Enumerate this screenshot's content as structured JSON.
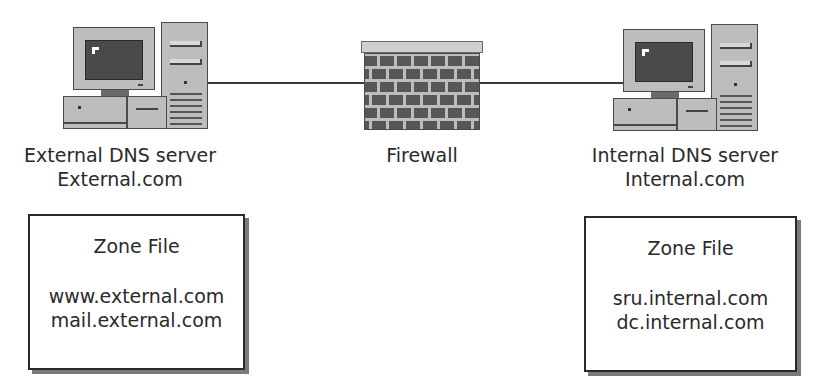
{
  "diagram": {
    "type": "network-dns-split",
    "nodes": [
      {
        "id": "external",
        "icon": "computer-icon",
        "label_line1": "External DNS server",
        "label_line2": "External.com"
      },
      {
        "id": "firewall",
        "icon": "brick-wall-icon",
        "label": "Firewall"
      },
      {
        "id": "internal",
        "icon": "computer-icon",
        "label_line1": "Internal DNS server",
        "label_line2": "Internal.com"
      }
    ],
    "edges": [
      {
        "from": "external",
        "to": "firewall"
      },
      {
        "from": "firewall",
        "to": "internal"
      }
    ],
    "zone_files": [
      {
        "owner": "external",
        "title": "Zone File",
        "entries": [
          "www.external.com",
          "mail.external.com"
        ]
      },
      {
        "owner": "internal",
        "title": "Zone File",
        "entries": [
          "sru.internal.com",
          "dc.internal.com"
        ]
      }
    ]
  },
  "colors": {
    "device_fill": "#bdbdbd",
    "screen": "#4a4a4a",
    "brick": "#575757",
    "line": "#3a3a3a",
    "text": "#2a2a2a"
  }
}
